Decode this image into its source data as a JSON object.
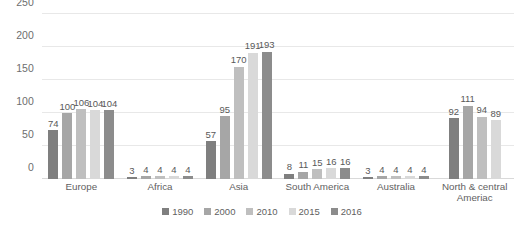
{
  "chart_data": {
    "type": "bar",
    "title": "",
    "subtitle": "",
    "xlabel": "",
    "ylabel": "",
    "ylim": [
      0,
      250
    ],
    "yticks": [
      0,
      50,
      100,
      150,
      200,
      250
    ],
    "grid": true,
    "legend_position": "bottom",
    "categories": [
      "Europe",
      "Africa",
      "Asia",
      "South America",
      "Australia",
      "North & central\nAmeriac"
    ],
    "series": [
      {
        "name": "1990",
        "color": "#7f7f7f",
        "values": [
          74,
          3,
          57,
          8,
          3,
          92
        ]
      },
      {
        "name": "2000",
        "color": "#a6a6a6",
        "values": [
          100,
          4,
          95,
          11,
          4,
          111
        ]
      },
      {
        "name": "2010",
        "color": "#bfbfbf",
        "values": [
          106,
          4,
          170,
          15,
          4,
          94
        ]
      },
      {
        "name": "2015",
        "color": "#d9d9d9",
        "values": [
          104,
          4,
          191,
          16,
          4,
          89
        ]
      },
      {
        "name": "2016",
        "color": "#8c8c8c",
        "values": [
          104,
          4,
          193,
          16,
          4,
          null
        ]
      }
    ]
  },
  "axis": {
    "y_tick_labels": [
      "0",
      "50",
      "100",
      "150",
      "200",
      "250"
    ]
  }
}
